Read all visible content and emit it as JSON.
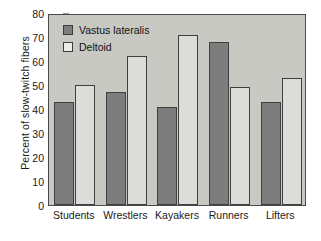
{
  "chart_data": {
    "type": "bar",
    "title": "",
    "xlabel": "",
    "ylabel": "Percent of slow-twitch fibers",
    "ylim": [
      0,
      80
    ],
    "yticks": [
      0,
      10,
      20,
      30,
      40,
      50,
      60,
      70,
      80
    ],
    "ytick_labels": [
      "0",
      "10",
      "20",
      "30",
      "40",
      "50",
      "60",
      "70",
      "80"
    ],
    "grid": false,
    "legend_position": "top-left",
    "categories": [
      "Students",
      "Wrestlers",
      "Kayakers",
      "Runners",
      "Lifters"
    ],
    "series": [
      {
        "name": "Vastus lateralis",
        "color": "#7d7d7d",
        "values": [
          43,
          47,
          41,
          68,
          43
        ]
      },
      {
        "name": "Deltoid",
        "color": "#ebebe7",
        "values": [
          50,
          62,
          71,
          49,
          53
        ]
      }
    ]
  },
  "colors": {
    "plot_background": "#c9c9c4",
    "axis": "#4a4a4a",
    "text": "#1a1a1a",
    "series_0": "#7d7d7d",
    "series_1": "#dcdcd8"
  }
}
